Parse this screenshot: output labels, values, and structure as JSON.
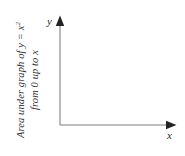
{
  "figure": {
    "background_color": "#ffffff",
    "axis_color": "#7a7a7a",
    "arrow_color": "#2b2b2b",
    "text_color": "#2f2f2f"
  },
  "axes": {
    "x_label": "x",
    "y_label": "y",
    "origin": {
      "x": 60,
      "y": 125
    },
    "x_axis_end": {
      "x": 176,
      "y": 125
    },
    "y_axis_end": {
      "x": 60,
      "y": 16
    }
  },
  "caption": {
    "rotation_degrees": -90,
    "line1_prefix": "Area under graph of ",
    "line1_var_y": "y",
    "line1_equals": " = ",
    "line1_var_x": "x",
    "line1_exponent": "2",
    "line2": "from 0 up to x"
  }
}
